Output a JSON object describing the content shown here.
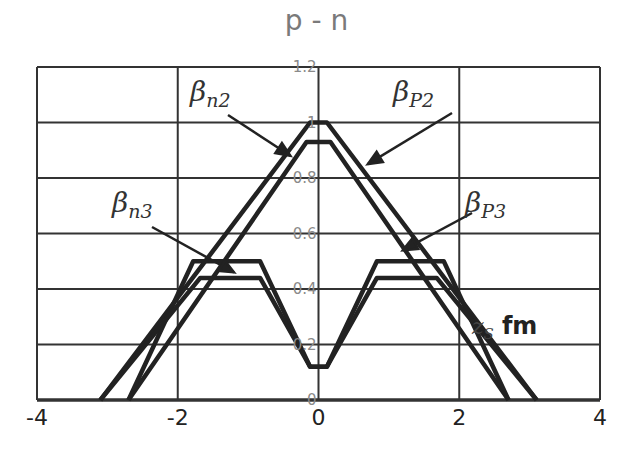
{
  "chart_data": {
    "type": "line",
    "title": "p - n",
    "xlabel": "z_S fm",
    "xlabel_var": "z",
    "xlabel_sub": "S",
    "xlabel_unit": "fm",
    "ylabel": "",
    "xlim": [
      -4,
      4
    ],
    "ylim": [
      0,
      1.2
    ],
    "grid": true,
    "x_ticks": [
      "-4",
      "-2",
      "0",
      "2",
      "4"
    ],
    "y_ticks": [
      "0",
      "0.2",
      "0.4",
      "0.6",
      "0.8",
      "1",
      "1.2"
    ],
    "legend_position": "annotations with arrows",
    "series": [
      {
        "name": "βP2",
        "label_base": "β",
        "label_sub": "P2",
        "x": [
          -3.1,
          -0.12,
          0.12,
          3.1
        ],
        "y": [
          0,
          1.0,
          1.0,
          0
        ]
      },
      {
        "name": "βn2",
        "label_base": "β",
        "label_sub": "n2",
        "x": [
          -2.7,
          -0.17,
          0.17,
          2.7
        ],
        "y": [
          0,
          0.93,
          0.93,
          0
        ]
      },
      {
        "name": "βP3",
        "label_base": "β",
        "label_sub": "P3",
        "x": [
          -2.7,
          -1.78,
          -0.83,
          -0.12,
          0.12,
          0.83,
          1.78,
          2.7
        ],
        "y": [
          0,
          0.5,
          0.5,
          0.12,
          0.12,
          0.5,
          0.5,
          0
        ]
      },
      {
        "name": "βn3",
        "label_base": "β",
        "label_sub": "n3",
        "x": [
          -3.1,
          -1.68,
          -0.83,
          -0.12,
          0.12,
          0.83,
          1.68,
          3.1
        ],
        "y": [
          0,
          0.44,
          0.44,
          0.12,
          0.12,
          0.44,
          0.44,
          0
        ]
      }
    ],
    "annotations": [
      {
        "text": "βn2",
        "arrow_to": [
          -0.4,
          0.88
        ]
      },
      {
        "text": "βP2",
        "arrow_to": [
          0.7,
          0.85
        ]
      },
      {
        "text": "βn3",
        "arrow_to": [
          -1.2,
          0.46
        ]
      },
      {
        "text": "βP3",
        "arrow_to": [
          1.2,
          0.54
        ]
      }
    ]
  }
}
